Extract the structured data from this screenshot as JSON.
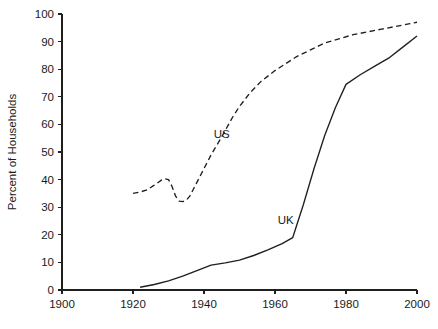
{
  "chart_data": {
    "type": "line",
    "title": "",
    "xlabel": "",
    "ylabel": "Percent of Households",
    "xlim": [
      1900,
      2000
    ],
    "ylim": [
      0,
      100
    ],
    "xticks": [
      1900,
      1920,
      1940,
      1960,
      1980,
      2000
    ],
    "xtick_labels": [
      "1900",
      "1920",
      "1940",
      "1960",
      "1980",
      "2000"
    ],
    "yticks": [
      0,
      10,
      20,
      30,
      40,
      50,
      60,
      70,
      80,
      90,
      100
    ],
    "ytick_labels": [
      "0",
      "10",
      "20",
      "30",
      "40",
      "50",
      "60",
      "70",
      "80",
      "90",
      "100"
    ],
    "grid": false,
    "legend_position": "inline-annotation",
    "series": [
      {
        "name": "US",
        "style": "dashed",
        "color": "#1f1f1f",
        "label_x": 1945,
        "label_y": 55,
        "points": [
          [
            1920,
            35.0
          ],
          [
            1922,
            35.5
          ],
          [
            1924,
            36.3
          ],
          [
            1926,
            38.0
          ],
          [
            1928,
            39.8
          ],
          [
            1929,
            40.3
          ],
          [
            1930,
            40.0
          ],
          [
            1931,
            37.5
          ],
          [
            1932,
            34.0
          ],
          [
            1933,
            32.2
          ],
          [
            1934,
            32.0
          ],
          [
            1935,
            32.5
          ],
          [
            1936,
            34.0
          ],
          [
            1937,
            36.5
          ],
          [
            1938,
            39.0
          ],
          [
            1940,
            44.0
          ],
          [
            1942,
            49.0
          ],
          [
            1945,
            55.5
          ],
          [
            1948,
            62.5
          ],
          [
            1950,
            66.5
          ],
          [
            1953,
            71.5
          ],
          [
            1956,
            75.5
          ],
          [
            1958,
            77.5
          ],
          [
            1960,
            79.5
          ],
          [
            1963,
            82.0
          ],
          [
            1966,
            84.5
          ],
          [
            1970,
            87.0
          ],
          [
            1974,
            89.5
          ],
          [
            1978,
            91.0
          ],
          [
            1982,
            92.5
          ],
          [
            1986,
            93.5
          ],
          [
            1990,
            94.5
          ],
          [
            1994,
            95.5
          ],
          [
            1998,
            96.5
          ],
          [
            2000,
            97.0
          ]
        ]
      },
      {
        "name": "UK",
        "style": "solid",
        "color": "#1f1f1f",
        "label_x": 1963,
        "label_y": 24,
        "points": [
          [
            1922,
            1.0
          ],
          [
            1926,
            2.0
          ],
          [
            1930,
            3.3
          ],
          [
            1934,
            5.0
          ],
          [
            1938,
            7.0
          ],
          [
            1942,
            9.0
          ],
          [
            1946,
            9.8
          ],
          [
            1950,
            10.8
          ],
          [
            1954,
            12.5
          ],
          [
            1958,
            14.5
          ],
          [
            1962,
            16.8
          ],
          [
            1965,
            19.0
          ],
          [
            1968,
            31.0
          ],
          [
            1971,
            44.0
          ],
          [
            1974,
            56.0
          ],
          [
            1977,
            66.0
          ],
          [
            1980,
            74.5
          ],
          [
            1984,
            78.0
          ],
          [
            1988,
            81.0
          ],
          [
            1992,
            84.0
          ],
          [
            1996,
            88.0
          ],
          [
            2000,
            92.0
          ]
        ]
      }
    ]
  }
}
